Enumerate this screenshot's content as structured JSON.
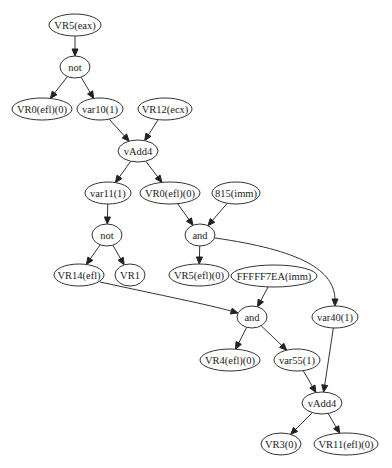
{
  "diagram": {
    "type": "directed-graph",
    "nodes": [
      {
        "id": "n1",
        "label": "VR5(eax)",
        "cx": 75,
        "cy": 25,
        "rx": 26,
        "ry": 11
      },
      {
        "id": "n2",
        "label": "not",
        "cx": 75,
        "cy": 67,
        "rx": 15,
        "ry": 11
      },
      {
        "id": "n3",
        "label": "VR0(efl)(0)",
        "cx": 42,
        "cy": 109,
        "rx": 30,
        "ry": 11
      },
      {
        "id": "n4",
        "label": "var10(1)",
        "cx": 100,
        "cy": 109,
        "rx": 23,
        "ry": 11
      },
      {
        "id": "n5",
        "label": "VR12(ecx)",
        "cx": 165,
        "cy": 109,
        "rx": 27,
        "ry": 11
      },
      {
        "id": "n6",
        "label": "vAdd4",
        "cx": 138,
        "cy": 151,
        "rx": 20,
        "ry": 11
      },
      {
        "id": "n7",
        "label": "var11(1)",
        "cx": 108,
        "cy": 193,
        "rx": 23,
        "ry": 11
      },
      {
        "id": "n8",
        "label": "VR0(efl)(0)",
        "cx": 170,
        "cy": 193,
        "rx": 30,
        "ry": 11
      },
      {
        "id": "n9",
        "label": "815(imm)",
        "cx": 236,
        "cy": 193,
        "rx": 24,
        "ry": 11
      },
      {
        "id": "n10",
        "label": "not",
        "cx": 107,
        "cy": 235,
        "rx": 15,
        "ry": 11
      },
      {
        "id": "n11",
        "label": "and",
        "cx": 200,
        "cy": 235,
        "rx": 15,
        "ry": 11
      },
      {
        "id": "n12",
        "label": "VR14(efl)",
        "cx": 79,
        "cy": 275,
        "rx": 25,
        "ry": 11
      },
      {
        "id": "n13",
        "label": "VR1",
        "cx": 130,
        "cy": 275,
        "rx": 15,
        "ry": 11
      },
      {
        "id": "n14",
        "label": "VR5(efl)(0)",
        "cx": 199,
        "cy": 275,
        "rx": 30,
        "ry": 11
      },
      {
        "id": "n15",
        "label": "FFFFF7EA(imm)",
        "cx": 274,
        "cy": 276,
        "rx": 43,
        "ry": 11
      },
      {
        "id": "n16",
        "label": "and",
        "cx": 252,
        "cy": 317,
        "rx": 15,
        "ry": 11
      },
      {
        "id": "n17",
        "label": "var40(1)",
        "cx": 335,
        "cy": 317,
        "rx": 23,
        "ry": 11
      },
      {
        "id": "n18",
        "label": "VR4(efl)(0)",
        "cx": 230,
        "cy": 360,
        "rx": 30,
        "ry": 11
      },
      {
        "id": "n19",
        "label": "var55(1)",
        "cx": 297,
        "cy": 360,
        "rx": 23,
        "ry": 11
      },
      {
        "id": "n20",
        "label": "vAdd4",
        "cx": 322,
        "cy": 403,
        "rx": 20,
        "ry": 11
      },
      {
        "id": "n21",
        "label": "VR3(0)",
        "cx": 281,
        "cy": 444,
        "rx": 20,
        "ry": 11
      },
      {
        "id": "n22",
        "label": "VR11(efl)(0)",
        "cx": 346,
        "cy": 444,
        "rx": 32,
        "ry": 11
      }
    ],
    "edges": [
      {
        "from": "n1",
        "to": "n2"
      },
      {
        "from": "n2",
        "to": "n3"
      },
      {
        "from": "n2",
        "to": "n4"
      },
      {
        "from": "n4",
        "to": "n6"
      },
      {
        "from": "n5",
        "to": "n6"
      },
      {
        "from": "n6",
        "to": "n7"
      },
      {
        "from": "n6",
        "to": "n8"
      },
      {
        "from": "n7",
        "to": "n10"
      },
      {
        "from": "n8",
        "to": "n11"
      },
      {
        "from": "n9",
        "to": "n11"
      },
      {
        "from": "n10",
        "to": "n12"
      },
      {
        "from": "n10",
        "to": "n13"
      },
      {
        "from": "n11",
        "to": "n14"
      },
      {
        "from": "n11",
        "to": "n17",
        "curve": "M215,238 C300,250 335,270 335,300"
      },
      {
        "from": "n12",
        "to": "n16",
        "curve": "M100,282 C160,295 210,305 236,315"
      },
      {
        "from": "n15",
        "to": "n16"
      },
      {
        "from": "n16",
        "to": "n18"
      },
      {
        "from": "n16",
        "to": "n19"
      },
      {
        "from": "n17",
        "to": "n20"
      },
      {
        "from": "n19",
        "to": "n20"
      },
      {
        "from": "n20",
        "to": "n21"
      },
      {
        "from": "n20",
        "to": "n22"
      }
    ],
    "colors": {
      "stroke": "#333333",
      "arrow": "#222222",
      "fill": "#ffffff",
      "text": "#222222"
    }
  }
}
